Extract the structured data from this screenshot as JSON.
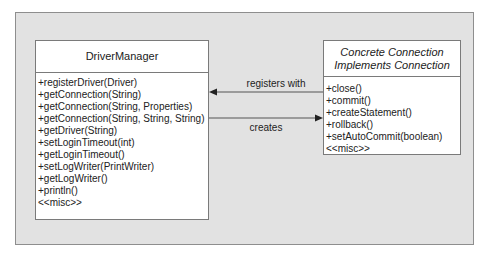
{
  "diagram": {
    "type": "uml-class",
    "colors": {
      "background": "#e2e2e2",
      "box_fill": "#ffffff",
      "border": "#7a7a7a",
      "line": "#555555"
    },
    "classes": [
      {
        "id": "driver-manager",
        "title": "DriverManager",
        "title_lines": [
          "DriverManager"
        ],
        "methods": [
          "+registerDriver(Driver)",
          "+getConnection(String)",
          "+getConnection(String, Properties)",
          "+getConnection(String, String, String)",
          "+getDriver(String)",
          "+setLoginTimeout(int)",
          "+getLoginTimeout()",
          "+setLogWriter(PrintWriter)",
          "+getLogWriter()",
          "+println()",
          "<<misc>>"
        ]
      },
      {
        "id": "concrete-connection",
        "title_lines": [
          "Concrete Connection",
          "Implements Connection"
        ],
        "methods": [
          "+close()",
          "+commit()",
          "+createStatement()",
          "+rollback()",
          "+setAutoCommit(boolean)",
          "<<misc>>"
        ]
      }
    ],
    "relationships": [
      {
        "label": "registers with",
        "from": "concrete-connection",
        "to": "driver-manager",
        "direction": "left"
      },
      {
        "label": "creates",
        "from": "driver-manager",
        "to": "concrete-connection",
        "direction": "right"
      }
    ]
  }
}
